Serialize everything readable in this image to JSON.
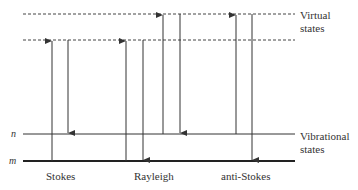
{
  "diagram": {
    "levels": {
      "virtual_label_line1": "Virtual",
      "virtual_label_line2": "states",
      "vibrational_label_line1": "Vibrational",
      "vibrational_label_line2": "states",
      "n_label": "n",
      "m_label": "m"
    },
    "transitions": [
      {
        "name": "Stokes",
        "label": "Stokes",
        "up": "m → lower virtual",
        "down": "lower virtual → n"
      },
      {
        "name": "Rayleigh",
        "label": "Rayleigh",
        "up": "m → lower virtual",
        "down": "lower virtual → m"
      },
      {
        "name": "Rayleigh-n",
        "label": "",
        "up": "n → upper virtual",
        "down": "upper virtual → n"
      },
      {
        "name": "anti-Stokes",
        "label": "anti-Stokes",
        "up": "n → upper virtual",
        "down": "upper virtual → m"
      }
    ],
    "colors": {
      "line": "#333333",
      "background": "#ffffff"
    }
  }
}
